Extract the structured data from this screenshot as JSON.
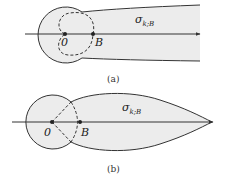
{
  "figure": {
    "panels": [
      {
        "id": "a",
        "caption": "(a)",
        "region_label": "σ",
        "region_subscript": "k;B",
        "origin_label": "0",
        "point_label": "B",
        "shape": "circle-with-strip"
      },
      {
        "id": "b",
        "caption": "(b)",
        "region_label": "σ",
        "region_subscript": "k;B",
        "origin_label": "0",
        "point_label": "B",
        "shape": "circle-with-teardrop"
      }
    ],
    "colors": {
      "fill": "#ececec",
      "stroke": "#333333",
      "background": "#ffffff"
    }
  }
}
